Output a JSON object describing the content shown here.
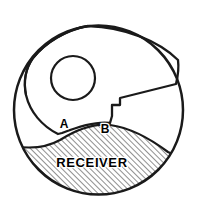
{
  "figure": {
    "type": "technical-line-drawing",
    "title_visible": false,
    "background_color": "#ffffff",
    "line_color": "#1a1a1a",
    "hatch_color": "#2a2a2a",
    "labels": {
      "point_a": "A",
      "point_b": "B",
      "region_receiver": "RECEIVER"
    },
    "geometry": {
      "outer_circle": {
        "cx": 98.5,
        "cy": 110,
        "r": 85.5,
        "stroke_width": 2.4
      },
      "inner_hole_circle": {
        "cx": 73,
        "cy": 78,
        "r": 22,
        "stroke_width": 2.2
      },
      "hatch_angle_deg": 45,
      "hatch_spacing_px": 4
    }
  }
}
